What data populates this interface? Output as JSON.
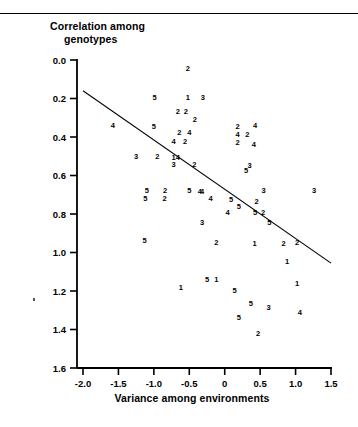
{
  "figure": {
    "ylabel_line1": "Correlation among",
    "ylabel_line2": "genotypes",
    "xlabel": "Variance among environments"
  },
  "axis": {
    "y_ticks": [
      "1.6",
      "1.4",
      "1.2",
      "1.0",
      "0.8",
      "0.6",
      "0.4",
      "0.2",
      "0.0"
    ],
    "x_ticks": [
      "-2.0",
      "-1.5",
      "-1.0",
      "-0.5",
      "0",
      "0.5",
      "1.0",
      "1.5"
    ]
  },
  "colors": {
    "ink": "#000000",
    "background": "#ffffff"
  },
  "chart_data": {
    "type": "scatter",
    "title": "",
    "xlabel": "Variance among environments",
    "ylabel": "Correlation among genotypes",
    "xlim": [
      -2.0,
      1.5
    ],
    "ylim": [
      0.0,
      1.6
    ],
    "xticks": [
      -2.0,
      -1.5,
      -1.0,
      -0.5,
      0,
      0.5,
      1.0,
      1.5
    ],
    "yticks": [
      0.0,
      0.2,
      0.4,
      0.6,
      0.8,
      1.0,
      1.2,
      1.4,
      1.6
    ],
    "grid": false,
    "legend": "none",
    "marker_style": "digit-label",
    "note": "Each plotted point is drawn as a digit character (1-5) denoting its group/replicate code.",
    "trendline": {
      "type": "line",
      "x": [
        -2.0,
        1.5
      ],
      "y": [
        1.44,
        0.545
      ]
    },
    "points": [
      {
        "x": -0.52,
        "y": 1.555,
        "label": "2"
      },
      {
        "x": -0.99,
        "y": 1.405,
        "label": "5"
      },
      {
        "x": -0.52,
        "y": 1.405,
        "label": "1"
      },
      {
        "x": -0.31,
        "y": 1.405,
        "label": "3"
      },
      {
        "x": -0.66,
        "y": 1.335,
        "label": "2"
      },
      {
        "x": -0.55,
        "y": 1.335,
        "label": "2"
      },
      {
        "x": -0.42,
        "y": 1.295,
        "label": "2"
      },
      {
        "x": -1.58,
        "y": 1.26,
        "label": "4"
      },
      {
        "x": -1.0,
        "y": 1.255,
        "label": "5"
      },
      {
        "x": 0.18,
        "y": 1.255,
        "label": "2"
      },
      {
        "x": 0.43,
        "y": 1.26,
        "label": "4"
      },
      {
        "x": -0.64,
        "y": 1.225,
        "label": "2"
      },
      {
        "x": -0.5,
        "y": 1.225,
        "label": "4"
      },
      {
        "x": 0.18,
        "y": 1.215,
        "label": "4"
      },
      {
        "x": 0.32,
        "y": 1.215,
        "label": "2"
      },
      {
        "x": -0.72,
        "y": 1.18,
        "label": "4"
      },
      {
        "x": -0.56,
        "y": 1.18,
        "label": "2"
      },
      {
        "x": 0.18,
        "y": 1.175,
        "label": "2"
      },
      {
        "x": 0.41,
        "y": 1.165,
        "label": "4"
      },
      {
        "x": -1.25,
        "y": 1.1,
        "label": "3"
      },
      {
        "x": -0.95,
        "y": 1.1,
        "label": "2"
      },
      {
        "x": -0.72,
        "y": 1.095,
        "label": "1"
      },
      {
        "x": -0.66,
        "y": 1.095,
        "label": "4"
      },
      {
        "x": -0.72,
        "y": 1.06,
        "label": "3"
      },
      {
        "x": -0.43,
        "y": 1.06,
        "label": "2"
      },
      {
        "x": 0.35,
        "y": 1.055,
        "label": "3"
      },
      {
        "x": 0.3,
        "y": 1.025,
        "label": "5"
      },
      {
        "x": -1.1,
        "y": 0.925,
        "label": "5"
      },
      {
        "x": -0.84,
        "y": 0.925,
        "label": "2"
      },
      {
        "x": -0.5,
        "y": 0.925,
        "label": "5"
      },
      {
        "x": -0.35,
        "y": 0.92,
        "label": "4"
      },
      {
        "x": -0.32,
        "y": 0.92,
        "label": "4"
      },
      {
        "x": 0.55,
        "y": 0.925,
        "label": "3"
      },
      {
        "x": 1.26,
        "y": 0.925,
        "label": "3"
      },
      {
        "x": -1.12,
        "y": 0.88,
        "label": "5"
      },
      {
        "x": -0.85,
        "y": 0.88,
        "label": "2"
      },
      {
        "x": -0.2,
        "y": 0.88,
        "label": "4"
      },
      {
        "x": 0.09,
        "y": 0.875,
        "label": "5"
      },
      {
        "x": 0.45,
        "y": 0.865,
        "label": "2"
      },
      {
        "x": 0.2,
        "y": 0.84,
        "label": "5"
      },
      {
        "x": 0.04,
        "y": 0.81,
        "label": "4"
      },
      {
        "x": 0.43,
        "y": 0.81,
        "label": "5"
      },
      {
        "x": 0.54,
        "y": 0.81,
        "label": "2"
      },
      {
        "x": -0.32,
        "y": 0.755,
        "label": "3"
      },
      {
        "x": 0.63,
        "y": 0.755,
        "label": "5"
      },
      {
        "x": -1.13,
        "y": 0.665,
        "label": "5"
      },
      {
        "x": -0.12,
        "y": 0.655,
        "label": "2"
      },
      {
        "x": 0.42,
        "y": 0.65,
        "label": "1"
      },
      {
        "x": 0.83,
        "y": 0.65,
        "label": "2"
      },
      {
        "x": 1.02,
        "y": 0.655,
        "label": "2"
      },
      {
        "x": 0.88,
        "y": 0.555,
        "label": "1"
      },
      {
        "x": -0.25,
        "y": 0.46,
        "label": "5"
      },
      {
        "x": -0.12,
        "y": 0.46,
        "label": "1"
      },
      {
        "x": 1.02,
        "y": 0.44,
        "label": "1"
      },
      {
        "x": -0.62,
        "y": 0.42,
        "label": "1"
      },
      {
        "x": 0.14,
        "y": 0.405,
        "label": "5"
      },
      {
        "x": 0.37,
        "y": 0.335,
        "label": "5"
      },
      {
        "x": 0.62,
        "y": 0.315,
        "label": "3"
      },
      {
        "x": 1.06,
        "y": 0.29,
        "label": "4"
      },
      {
        "x": 0.2,
        "y": 0.265,
        "label": "5"
      },
      {
        "x": 0.47,
        "y": 0.18,
        "label": "2"
      }
    ]
  }
}
